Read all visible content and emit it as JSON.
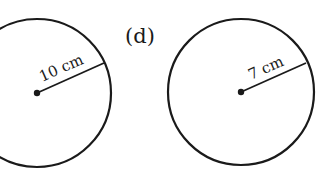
{
  "figure": {
    "part_label": "(d)",
    "circles": [
      {
        "id": "left",
        "radius_label": "10 cm",
        "center": [
          37,
          93
        ],
        "radius_px": 74,
        "radius_end": [
          104,
          63
        ]
      },
      {
        "id": "right",
        "radius_label": "7 cm",
        "center": [
          241,
          92
        ],
        "radius_px": 73,
        "radius_end": [
          306,
          63
        ]
      }
    ],
    "stroke_color": "#1a1a1a",
    "background": "#ffffff"
  }
}
